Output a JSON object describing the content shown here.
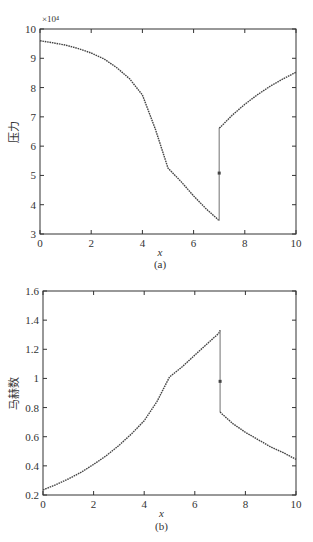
{
  "figure": {
    "background": "#ffffff",
    "line_color": "#444444"
  },
  "chart_data": [
    {
      "type": "line",
      "panel_label": "(a)",
      "title": "",
      "xlabel": "x",
      "ylabel": "压力",
      "y_multiplier": "×10⁴",
      "xlim": [
        0,
        10
      ],
      "ylim": [
        3,
        10
      ],
      "x_ticks": [
        0,
        2,
        4,
        6,
        8,
        10
      ],
      "y_ticks": [
        3,
        4,
        5,
        6,
        7,
        8,
        9,
        10
      ],
      "grid": false,
      "series": [
        {
          "name": "pressure",
          "x": [
            0,
            0.5,
            1,
            1.5,
            2,
            2.5,
            3,
            3.5,
            4,
            4.5,
            5,
            5.5,
            6,
            6.5,
            6.95,
            7.0,
            7.0,
            7.05,
            7.5,
            8,
            8.5,
            9,
            9.5,
            10
          ],
          "y": [
            9.6,
            9.53,
            9.45,
            9.33,
            9.18,
            8.98,
            8.68,
            8.3,
            7.75,
            6.6,
            5.25,
            4.8,
            4.3,
            3.85,
            3.5,
            3.45,
            6.62,
            6.65,
            7.05,
            7.43,
            7.76,
            8.05,
            8.3,
            8.52
          ]
        }
      ],
      "annotations": [
        {
          "x": 7.0,
          "y": 5.08,
          "text": "shock midpoint marker"
        }
      ]
    },
    {
      "type": "line",
      "panel_label": "(b)",
      "title": "",
      "xlabel": "x",
      "ylabel": "马赫数",
      "xlim": [
        0,
        10
      ],
      "ylim": [
        0.2,
        1.6
      ],
      "x_ticks": [
        0,
        2,
        4,
        6,
        8,
        10
      ],
      "y_ticks": [
        0.2,
        0.4,
        0.6,
        0.8,
        1,
        1.2,
        1.4,
        1.6
      ],
      "y_tick_labels": [
        "0.2",
        "0.4",
        "0.6",
        "0.8",
        "1",
        "1.2",
        "1.4",
        "1.6"
      ],
      "grid": false,
      "series": [
        {
          "name": "mach",
          "x": [
            0,
            0.5,
            1,
            1.5,
            2,
            2.5,
            3,
            3.5,
            4,
            4.5,
            5,
            5.5,
            6,
            6.5,
            6.95,
            7.0,
            7.0,
            7.05,
            7.5,
            8,
            8.5,
            9,
            9.5,
            10
          ],
          "y": [
            0.235,
            0.27,
            0.31,
            0.355,
            0.41,
            0.47,
            0.54,
            0.62,
            0.71,
            0.84,
            1.01,
            1.08,
            1.16,
            1.24,
            1.31,
            1.33,
            0.77,
            0.76,
            0.69,
            0.63,
            0.58,
            0.53,
            0.49,
            0.445
          ]
        }
      ],
      "annotations": [
        {
          "x": 7.0,
          "y": 0.98,
          "text": "shock midpoint marker"
        }
      ]
    }
  ]
}
